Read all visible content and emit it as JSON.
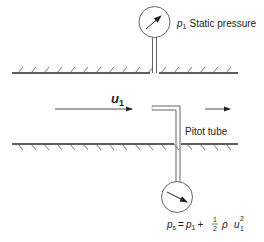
{
  "diagram": {
    "labels": {
      "static_symbol": "p",
      "static_sub": "1",
      "static_text": "Static pressure",
      "velocity_symbol": "u",
      "velocity_sub": "1",
      "pitot_text": "Pitot tube"
    },
    "formula": {
      "lhs_symbol": "p",
      "lhs_sub": "s",
      "equals": "=",
      "p_symbol": "p",
      "p_sub": "1",
      "plus": "+",
      "frac_num": "1",
      "frac_den": "2",
      "rho": "ρ",
      "u_symbol": "u",
      "u_sub": "1",
      "u_sup": "2"
    },
    "colors": {
      "stroke": "#3a3a3a",
      "text": "#222222",
      "background": "#ffffff"
    }
  }
}
